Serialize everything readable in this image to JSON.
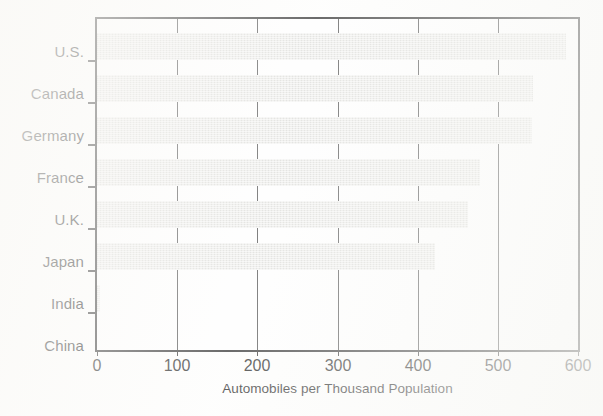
{
  "chart_data": {
    "type": "bar",
    "orientation": "horizontal",
    "title": "",
    "subtitle": "",
    "xlabel": "Automobiles per Thousand Population",
    "ylabel": "",
    "categories": [
      "U.S.",
      "Canada",
      "Germany",
      "France",
      "U.K.",
      "Japan",
      "India",
      "China"
    ],
    "values": [
      585,
      544,
      543,
      478,
      463,
      422,
      4,
      1
    ],
    "xlim": [
      0,
      600
    ],
    "xticks": [
      0,
      100,
      200,
      300,
      400,
      500,
      600
    ],
    "xticklabels": [
      "0",
      "100",
      "200",
      "300",
      "400",
      "500",
      "600"
    ],
    "grid": "vertical-only",
    "legend": null,
    "bar_color": "#e9e9e6",
    "axis_color": "#2b2b2b",
    "gridline_color": "#4a4a4a",
    "background_color": "#fdfdfc"
  },
  "figure": {
    "axis_label_x": "Automobiles per Thousand Population"
  }
}
